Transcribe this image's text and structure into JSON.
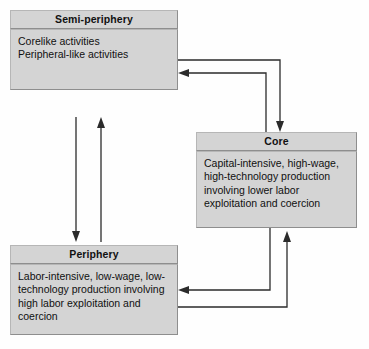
{
  "diagram": {
    "nodes": [
      {
        "id": "semi-periphery",
        "label": "Semi-periphery",
        "lines": [
          "Corelike activities",
          "Peripheral-like activities"
        ]
      },
      {
        "id": "core",
        "label": "Core",
        "lines": [
          "Capital-intensive, high-wage,",
          "high-technology production",
          "involving lower labor",
          "exploitation and coercion"
        ]
      },
      {
        "id": "periphery",
        "label": "Periphery",
        "lines": [
          "Labor-intensive, low-wage, low-",
          "technology production involving",
          "high labor exploitation and",
          "coercion"
        ]
      }
    ],
    "connectors": [
      {
        "id": "semi-to-core",
        "from": "semi-periphery",
        "to": "core",
        "arrow": "down-into-core"
      },
      {
        "id": "core-to-semi",
        "from": "core",
        "to": "semi-periphery",
        "arrow": "left-into-semi-periphery"
      },
      {
        "id": "semi-to-periphery",
        "from": "semi-periphery",
        "to": "periphery",
        "arrow": "down-into-periphery"
      },
      {
        "id": "periphery-to-semi",
        "from": "periphery",
        "to": "semi-periphery",
        "arrow": "up-into-semi-periphery"
      },
      {
        "id": "core-to-periphery",
        "from": "core",
        "to": "periphery",
        "arrow": "left-into-periphery"
      },
      {
        "id": "periphery-to-core",
        "from": "periphery",
        "to": "core",
        "arrow": "up-into-core"
      }
    ],
    "colors": {
      "box_fill": "#d4d4d4",
      "box_border": "#8e8e8e",
      "connector": "#2b2b2b",
      "background": "#fefefe",
      "text": "#101010"
    }
  }
}
